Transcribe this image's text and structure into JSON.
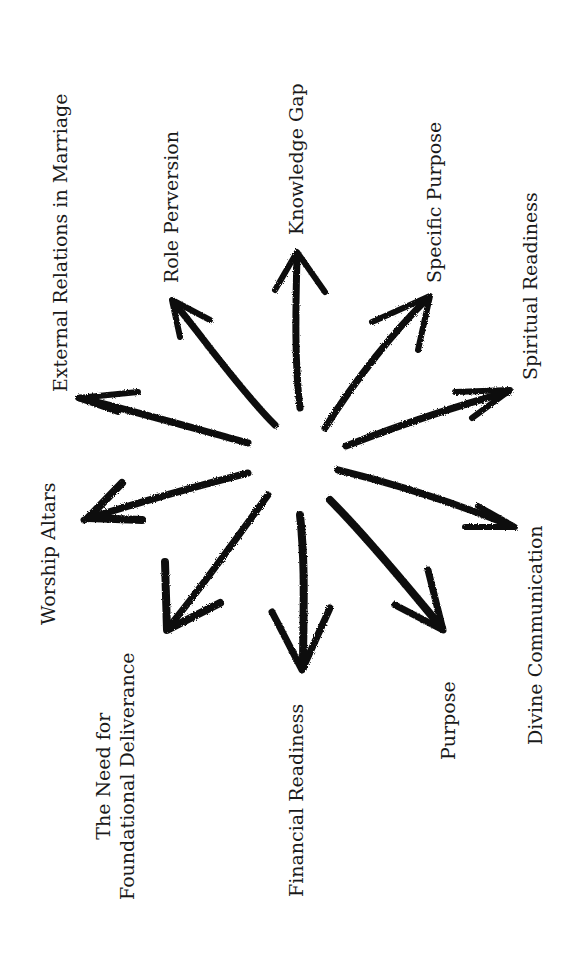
{
  "diagram": {
    "type": "radial-arrows",
    "ink_color": "#111111",
    "background": "#ffffff",
    "labels": [
      {
        "id": "external-relations",
        "text": "External Relations in Marriage"
      },
      {
        "id": "role-perversion",
        "text": "Role Perversion"
      },
      {
        "id": "knowledge-gap",
        "text": "Knowledge Gap"
      },
      {
        "id": "specific-purpose",
        "text": "Specific Purpose"
      },
      {
        "id": "spiritual-readiness",
        "text": "Spiritual Readiness"
      },
      {
        "id": "worship-altars",
        "text": "Worship Altars"
      },
      {
        "id": "foundational-deliverance",
        "line1": "The Need for",
        "line2": "Foundational Deliverance"
      },
      {
        "id": "financial-readiness",
        "text": "Financial Readiness"
      },
      {
        "id": "purpose",
        "text": "Purpose"
      },
      {
        "id": "divine-communication",
        "text": "Divine Communication"
      }
    ]
  }
}
